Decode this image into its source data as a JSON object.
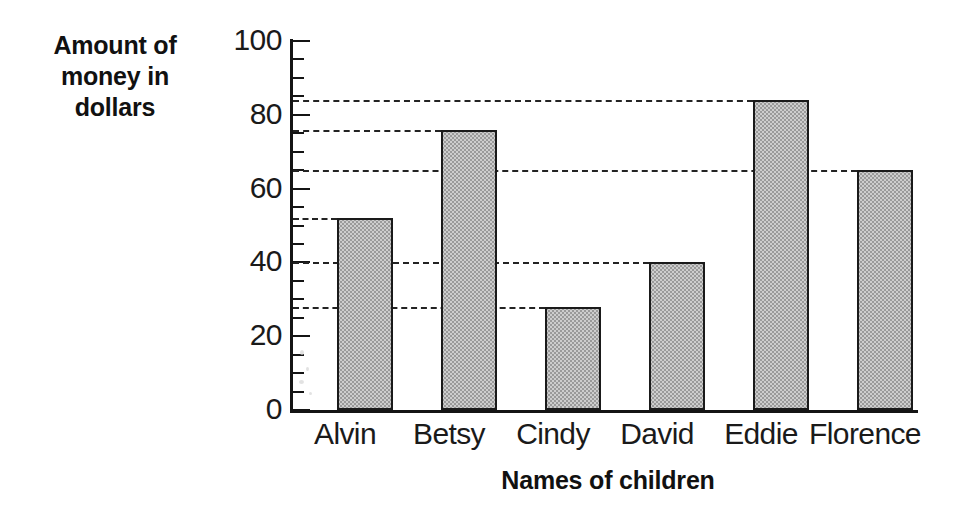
{
  "chart_data": {
    "type": "bar",
    "title": "",
    "subtitle": "",
    "xlabel": "Names of children",
    "ylabel": "Amount of money in dollars",
    "ylabel_lines": [
      "Amount of",
      "money in",
      "dollars"
    ],
    "categories": [
      "Alvin",
      "Betsy",
      "Cindy",
      "David",
      "Eddie",
      "Florence"
    ],
    "values": [
      52,
      76,
      28,
      40,
      84,
      65
    ],
    "ylim": [
      0,
      100
    ],
    "y_major_ticks": [
      0,
      20,
      40,
      60,
      80,
      100
    ],
    "y_minor_tick_step": 5,
    "y_tick_labels": [
      "0",
      "20",
      "40",
      "60",
      "80",
      "100"
    ],
    "grid": false,
    "leader_lines": true,
    "legend": "none",
    "bar_fill_color": "#cdcdcd",
    "bar_edge_color": "#1a1a1a",
    "axis_color": "#141414",
    "leader_line_color": "#232323",
    "background_color": "#ffffff",
    "units": "dollars"
  }
}
